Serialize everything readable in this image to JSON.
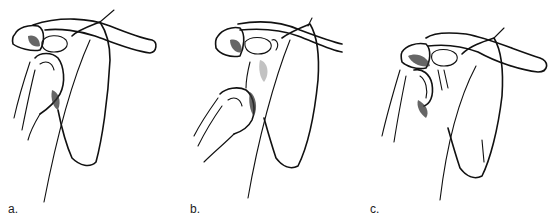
{
  "figure": {
    "panels": [
      {
        "id": "a",
        "label": "a."
      },
      {
        "id": "b",
        "label": "b."
      },
      {
        "id": "c",
        "label": "c."
      }
    ],
    "ink_color": "#111111",
    "background": "#ffffff"
  }
}
